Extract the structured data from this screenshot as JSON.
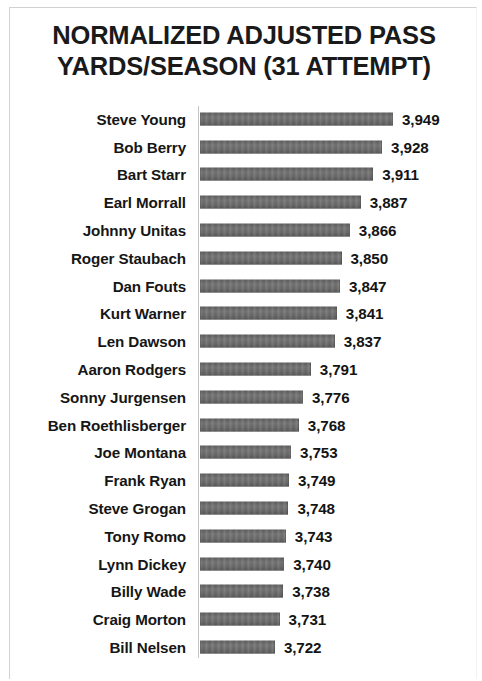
{
  "chart_data": {
    "type": "bar",
    "orientation": "horizontal",
    "title": "NORMALIZED ADJUSTED PASS YARDS/SEASON (31 ATTEMPT)",
    "title_lines": [
      "NORMALIZED ADJUSTED PASS",
      "YARDS/SEASON (31 ATTEMPT)"
    ],
    "xlabel": "",
    "ylabel": "",
    "grid": false,
    "legend": false,
    "axis_baseline_value": 3578,
    "xlim": [
      3578,
      3960
    ],
    "bar_color": "#6b6b6b",
    "axis_line_color": "#c4c4c4",
    "text_color": "#161616",
    "categories": [
      "Steve Young",
      "Bob Berry",
      "Bart Starr",
      "Earl Morrall",
      "Johnny Unitas",
      "Roger Staubach",
      "Dan Fouts",
      "Kurt Warner",
      "Len Dawson",
      "Aaron Rodgers",
      "Sonny Jurgensen",
      "Ben Roethlisberger",
      "Joe Montana",
      "Frank Ryan",
      "Steve Grogan",
      "Tony Romo",
      "Lynn Dickey",
      "Billy Wade",
      "Craig Morton",
      "Bill Nelsen"
    ],
    "values": [
      3949,
      3928,
      3911,
      3887,
      3866,
      3850,
      3847,
      3841,
      3837,
      3791,
      3776,
      3768,
      3753,
      3749,
      3748,
      3743,
      3740,
      3738,
      3731,
      3722
    ],
    "value_labels": [
      "3,949",
      "3,928",
      "3,911",
      "3,887",
      "3,866",
      "3,850",
      "3,847",
      "3,841",
      "3,837",
      "3,791",
      "3,776",
      "3,768",
      "3,753",
      "3,749",
      "3,748",
      "3,743",
      "3,740",
      "3,738",
      "3,731",
      "3,722"
    ]
  }
}
